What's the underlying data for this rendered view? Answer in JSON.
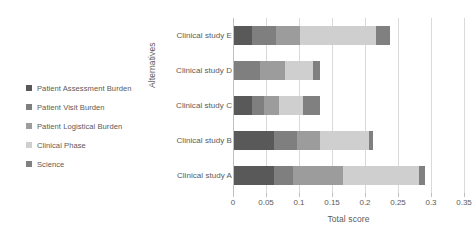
{
  "chart_data": {
    "type": "bar",
    "orientation": "horizontal",
    "stacked": true,
    "title": "",
    "xlabel": "Total score",
    "ylabel": "Alternatives",
    "xlim": [
      0,
      0.35
    ],
    "ylim": null,
    "grid": true,
    "gridlines_axis": "x",
    "legend_position": "left",
    "xticks": [
      0,
      0.05,
      0.1,
      0.15,
      0.2,
      0.25,
      0.3,
      0.35
    ],
    "xtick_labels": [
      "0",
      "0.05",
      "0.1",
      "0.15",
      "0.2",
      "0.25",
      "0.3",
      "0.35"
    ],
    "categories": [
      "Clinical study A",
      "Clinical study B",
      "Clinical study C",
      "Clinical study D",
      "Clinical study E"
    ],
    "series": [
      {
        "name": "Patient Assessment Burden",
        "color": "#595959",
        "values": [
          0.06,
          0.06,
          0.028,
          0.0,
          0.028
        ]
      },
      {
        "name": "Patient Visit Burden",
        "color": "#7f7f7f",
        "values": [
          0.03,
          0.035,
          0.018,
          0.04,
          0.035
        ]
      },
      {
        "name": "Patient Logistical Burden",
        "color": "#9c9c9c",
        "values": [
          0.075,
          0.035,
          0.022,
          0.038,
          0.037
        ]
      },
      {
        "name": "Clinical Phase",
        "color": "#cfcfcf",
        "values": [
          0.115,
          0.075,
          0.037,
          0.042,
          0.115
        ]
      },
      {
        "name": "Science",
        "color": "#808080",
        "values": [
          0.009,
          0.006,
          0.026,
          0.011,
          0.022
        ]
      }
    ],
    "totals": [
      0.289,
      0.211,
      0.131,
      0.131,
      0.237
    ]
  },
  "legend": {
    "items": [
      {
        "label": "Patient Assessment Burden",
        "color": "#595959"
      },
      {
        "label": "Patient Visit Burden",
        "color": "#7f7f7f"
      },
      {
        "label": "Patient Logistical Burden",
        "color": "#9c9c9c"
      },
      {
        "label": "Clinical Phase",
        "color": "#cfcfcf"
      },
      {
        "label": "Science",
        "color": "#808080"
      }
    ]
  },
  "axes": {
    "x_title": "Total score",
    "y_title": "Alternatives"
  }
}
